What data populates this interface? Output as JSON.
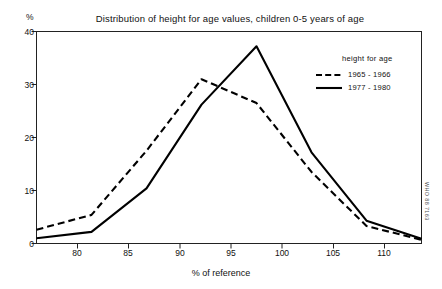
{
  "chart_data": {
    "type": "line",
    "title": "Distribution of height for age values, children 0-5 years of age",
    "xlabel": "% of reference",
    "ylabel": "%",
    "xlim": [
      77.5,
      112.5
    ],
    "ylim": [
      0,
      40
    ],
    "grid": false,
    "legend_position": "top-right-inside",
    "legend_title": "height for age",
    "xticks": [
      80,
      85,
      90,
      95,
      100,
      105,
      110
    ],
    "yticks": [
      0,
      10,
      20,
      30,
      40
    ],
    "x": [
      77.5,
      82.5,
      87.5,
      92.5,
      97.5,
      102.5,
      107.5,
      112.5
    ],
    "series": [
      {
        "name": "1965 - 1966",
        "style": "dashed",
        "color": "#000000",
        "values": [
          2.6,
          5.4,
          17.5,
          31.0,
          26.5,
          13.5,
          3.3,
          0.7
        ]
      },
      {
        "name": "1977 - 1980",
        "style": "solid",
        "color": "#000000",
        "values": [
          1.0,
          2.2,
          10.4,
          26.2,
          37.2,
          17.2,
          4.3,
          0.9
        ]
      }
    ],
    "annotations": [
      {
        "name": "who-source-code",
        "text": "WHO 88 7163"
      }
    ]
  },
  "legend": {
    "title": "height for age",
    "entries": [
      {
        "label": "1965 - 1966",
        "style": "dashed"
      },
      {
        "label": "1977 - 1980",
        "style": "solid"
      }
    ]
  },
  "axis": {
    "y_unit": "%",
    "x_title": "% of reference",
    "y_tick_labels": [
      "40",
      "30",
      "20",
      "10",
      "0"
    ],
    "x_tick_labels": [
      "80",
      "85",
      "90",
      "95",
      "100",
      "105",
      "110"
    ]
  },
  "title": "Distribution of height for age values, children 0-5 years of age",
  "source_code": "WHO 88 7163"
}
